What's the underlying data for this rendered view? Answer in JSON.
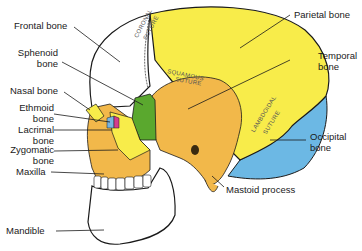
{
  "diagram": {
    "colors": {
      "frontal": "#ffffff",
      "parietal": "#f8ec4a",
      "temporal": "#f2b84a",
      "sphenoid": "#5aa82e",
      "occipital": "#6cb8e4",
      "zygomatic": "#f8ec4a",
      "maxilla": "#f2b84a",
      "nasal": "#f8ec4a",
      "lacrimal": "#d43c8c",
      "ethmoid": "#78b4e0",
      "mandible": "#ffffff",
      "outline": "#1a1a1a"
    },
    "labels": {
      "frontal": "Frontal bone",
      "sphenoid_1": "Sphenoid",
      "sphenoid_2": "bone",
      "nasal": "Nasal bone",
      "ethmoid_1": "Ethmoid",
      "ethmoid_2": "bone",
      "lacrimal_1": "Lacrimal",
      "lacrimal_2": "bone",
      "zygomatic_1": "Zygomatic",
      "zygomatic_2": "bone",
      "maxilla": "Maxilla",
      "mandible": "Mandible",
      "parietal": "Parietal bone",
      "temporal_1": "Temporal",
      "temporal_2": "bone",
      "occipital_1": "Occipital",
      "occipital_2": "bone",
      "mastoid": "Mastoid process"
    },
    "sutures": {
      "coronal_1": "CORONAL",
      "coronal_2": "SUTURE",
      "squamous_1": "SQUAMOUS",
      "squamous_2": "SUTURE",
      "lambdoidal_1": "LAMBDOIDAL",
      "lambdoidal_2": "SUTURE"
    }
  }
}
